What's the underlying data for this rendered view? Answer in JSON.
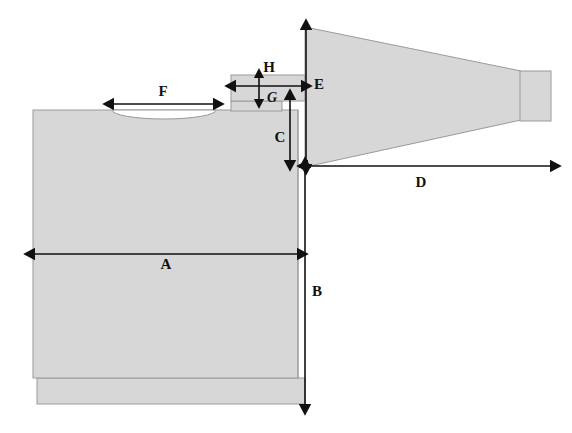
{
  "figure": {
    "type": "engineering-dimension-diagram",
    "background_color": "#ffffff",
    "fill_color": "#d7d7d7",
    "outline_color": "#9a9a9a",
    "arrow_color": "#111111"
  },
  "dimensions": [
    {
      "key": "A",
      "label": "A",
      "orientation": "horizontal",
      "arrow_style": "double",
      "measures": "main body width",
      "label_x": 166,
      "label_y": 265,
      "x1": 35,
      "y1": 254,
      "x2": 297,
      "y2": 254
    },
    {
      "key": "B",
      "label": "B",
      "orientation": "vertical",
      "arrow_style": "double",
      "measures": "overall body height from shoulder to base",
      "label_x": 316,
      "label_y": 293,
      "x1": 305,
      "y1": 168,
      "x2": 305,
      "y2": 404
    },
    {
      "key": "C",
      "label": "C",
      "orientation": "vertical",
      "arrow_style": "double",
      "measures": "neck step height",
      "label_x": 280,
      "label_y": 139,
      "x1": 290,
      "y1": 100,
      "x2": 290,
      "y2": 160
    },
    {
      "key": "D",
      "label": "D",
      "orientation": "horizontal",
      "arrow_style": "double",
      "measures": "horn length",
      "label_x": 421,
      "label_y": 183,
      "x1": 308,
      "y1": 166,
      "x2": 550,
      "y2": 166
    },
    {
      "key": "E",
      "label": "E",
      "orientation": "vertical",
      "arrow_style": "double",
      "measures": "horn inlet height",
      "label_x": 318,
      "label_y": 86,
      "x1": 306,
      "y1": 30,
      "x2": 306,
      "y2": 164
    },
    {
      "key": "F",
      "label": "F",
      "orientation": "horizontal",
      "arrow_style": "double",
      "measures": "width of the dished recess in the body top",
      "label_x": 163,
      "label_y": 93,
      "x1": 114,
      "y1": 104,
      "x2": 213,
      "y2": 104
    },
    {
      "key": "G",
      "label": "G",
      "orientation": "vertical",
      "arrow_style": "double",
      "measures": "tab thickness",
      "label_x": 271,
      "label_y": 99,
      "x1": 259,
      "y1": 78,
      "x2": 259,
      "y2": 98
    },
    {
      "key": "H",
      "label": "H",
      "orientation": "horizontal",
      "arrow_style": "double",
      "measures": "tab length",
      "label_x": 269,
      "label_y": 69,
      "x1": 236,
      "y1": 86,
      "x2": 301,
      "y2": 86
    }
  ],
  "shapes": {
    "main_body": {
      "name": "main-body",
      "x": 33,
      "y": 110,
      "width": 265,
      "height": 268
    },
    "base_plinth": {
      "name": "base-plinth",
      "x": 37,
      "y": 378,
      "width": 268,
      "height": 26
    },
    "shoulder_step": {
      "name": "shoulder-step",
      "x": 231,
      "y": 101,
      "width": 51,
      "height": 9
    },
    "neck_tab": {
      "name": "neck-tab",
      "x": 231,
      "y": 75,
      "width": 74,
      "height": 26
    },
    "recess_ellipse": {
      "name": "recess-ellipse",
      "cx": 164,
      "cy": 110,
      "rx": 52,
      "ry": 9
    },
    "horn": {
      "name": "horn-cone",
      "points": "305,27 520,71 520,120 305,167"
    },
    "nozzle": {
      "name": "nozzle",
      "x": 520,
      "y": 71,
      "width": 31,
      "height": 50
    }
  }
}
